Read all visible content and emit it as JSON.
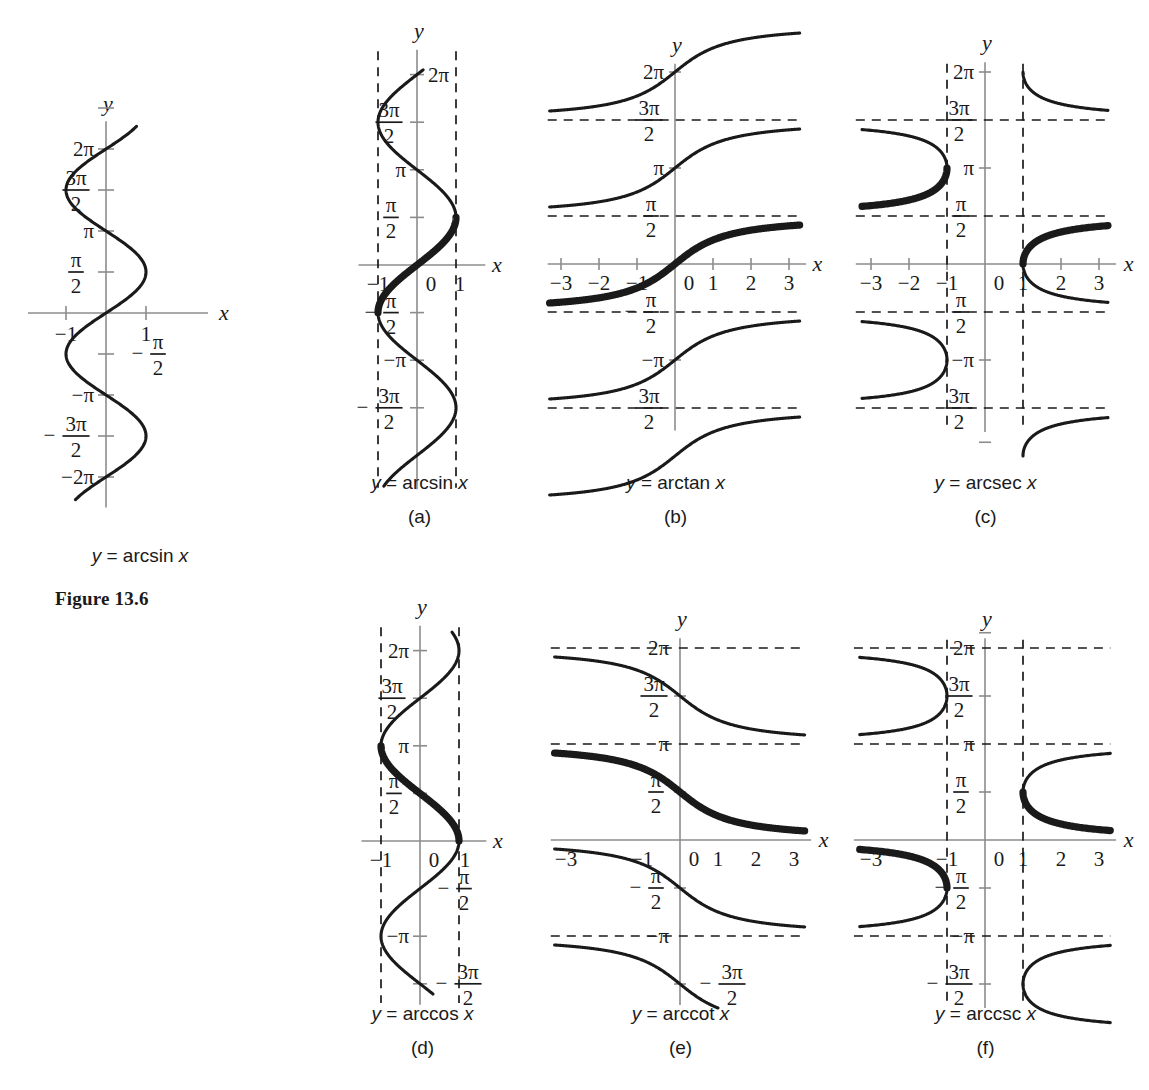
{
  "figure": {
    "label": "Figure 13.6",
    "main_caption": "y = arcsin x"
  },
  "panels": [
    {
      "id": "a",
      "caption": "y = arcsin x",
      "letter": "(a)",
      "function": "arcsin"
    },
    {
      "id": "b",
      "caption": "y = arctan x",
      "letter": "(b)",
      "function": "arctan"
    },
    {
      "id": "c",
      "caption": "y = arcsec x",
      "letter": "(c)",
      "function": "arcsec"
    },
    {
      "id": "d",
      "caption": "y = arccos x",
      "letter": "(d)",
      "function": "arccos"
    },
    {
      "id": "e",
      "caption": "y = arccot x",
      "letter": "(e)",
      "function": "arccot"
    },
    {
      "id": "f",
      "caption": "y = arccsc x",
      "letter": "(f)",
      "function": "arccsc"
    }
  ],
  "axis_names": {
    "x": "x",
    "y": "y"
  },
  "tick_labels": {
    "two_pi": "2π",
    "three_pi_over_two": "3π/2",
    "pi": "π",
    "pi_over_two": "π/2",
    "neg_pi_over_two": "−π/2",
    "neg_pi": "−π",
    "neg_three_pi_over_two": "− 3π/2",
    "neg_two_pi": "−2π",
    "x_neg3": "−3",
    "x_neg2": "−2",
    "x_neg1": "−1",
    "x_0": "0",
    "x_1": "1",
    "x_2": "2",
    "x_3": "3"
  },
  "chart_data": [
    {
      "type": "line",
      "name": "main-arcsin",
      "title": "y = arcsin x",
      "xlabel": "x",
      "ylabel": "y",
      "xlim": [
        -1.55,
        1.55
      ],
      "ylim": [
        -7.3,
        7.6
      ],
      "grid": false,
      "legend": null,
      "description": "Full multivalued arcsine relation: sideways sine curve x = sin y",
      "xticks": [
        -1,
        1
      ],
      "xticklabels": [
        "−1",
        "1"
      ],
      "yticks": [
        -6.283,
        -4.712,
        -3.142,
        -1.571,
        1.571,
        3.142,
        4.712,
        6.283
      ],
      "yticklabels": [
        "−2π",
        "− 3π/2",
        "−π",
        "−π/2",
        "π/2",
        "π",
        "3π/2",
        "2π"
      ],
      "series": [
        {
          "name": "x = sin y",
          "relation": "x=sin(y)",
          "y_range": [
            -7.1,
            7.1
          ],
          "bold": false
        }
      ]
    },
    {
      "type": "line",
      "name": "panel-a-arcsin",
      "title": "y = arcsin x",
      "xlabel": "x",
      "ylabel": "y",
      "xlim": [
        -1.45,
        1.45
      ],
      "ylim": [
        -7.6,
        7.3
      ],
      "grid": false,
      "asymptotes_vertical": [
        -1,
        1
      ],
      "xticks": [
        -1,
        0,
        1
      ],
      "xticklabels": [
        "−1",
        "0",
        "1"
      ],
      "yticks": [
        -4.712,
        -3.142,
        -1.571,
        1.571,
        3.142,
        4.712,
        6.283
      ],
      "yticklabels": [
        "− 3π/2",
        "−π",
        "−π/2",
        "π/2",
        "π",
        "3π/2",
        "2π"
      ],
      "series": [
        {
          "name": "all branches",
          "relation": "x=sin(y)",
          "y_range": [
            -7.2,
            6.45
          ],
          "bold": false
        },
        {
          "name": "principal branch",
          "relation": "x=sin(y)",
          "y_range": [
            -1.571,
            1.571
          ],
          "bold": true
        }
      ]
    },
    {
      "type": "line",
      "name": "panel-b-arctan",
      "title": "y = arctan x",
      "xlabel": "x",
      "ylabel": "y",
      "xlim": [
        -3.3,
        3.3
      ],
      "ylim": [
        -5.6,
        6.7
      ],
      "grid": false,
      "asymptotes_horizontal": [
        -4.712,
        -1.571,
        1.571,
        4.712
      ],
      "xticks": [
        -3,
        -2,
        -1,
        0,
        1,
        2,
        3
      ],
      "xticklabels": [
        "−3",
        "−2",
        "−1",
        "0",
        "1",
        "2",
        "3"
      ],
      "yticks": [
        -4.712,
        -3.142,
        -1.571,
        1.571,
        3.142,
        4.712,
        6.283
      ],
      "yticklabels": [
        "3π/2",
        "−π",
        "−π/2",
        "π/2",
        "π",
        "3π/2",
        "2π"
      ],
      "series": [
        {
          "name": "branch k=-2",
          "relation": "atan(x)-2*pi",
          "bold": false
        },
        {
          "name": "branch k=-1",
          "relation": "atan(x)-pi",
          "bold": false
        },
        {
          "name": "principal branch",
          "relation": "atan(x)",
          "bold": true
        },
        {
          "name": "branch k=1",
          "relation": "atan(x)+pi",
          "bold": false
        },
        {
          "name": "branch k=2",
          "relation": "atan(x)+2*pi",
          "bold": false
        }
      ]
    },
    {
      "type": "line",
      "name": "panel-c-arcsec",
      "title": "y = arcsec x",
      "xlabel": "x",
      "ylabel": "y",
      "xlim": [
        -3.3,
        3.3
      ],
      "ylim": [
        -5.6,
        6.7
      ],
      "grid": false,
      "asymptotes_vertical": [
        -1,
        1
      ],
      "asymptotes_horizontal": [
        -4.712,
        -1.571,
        1.571,
        4.712
      ],
      "xticks": [
        -3,
        -2,
        -1,
        0,
        1,
        2,
        3
      ],
      "xticklabels": [
        "−3",
        "−2",
        "−1",
        "0",
        "1",
        "2",
        "3"
      ],
      "yticks": [
        -4.712,
        -3.142,
        -1.571,
        1.571,
        3.142,
        4.712,
        6.283
      ],
      "yticklabels": [
        "3π/2",
        "−π",
        "−π/2",
        "π/2",
        "π",
        "3π/2",
        "2π"
      ],
      "series": [
        {
          "name": "principal right branch",
          "relation": "x=sec(y)",
          "y_range": [
            0,
            1.231
          ],
          "bold": true
        },
        {
          "name": "principal left branch",
          "relation": "x=sec(y)",
          "y_range": [
            1.911,
            3.142
          ],
          "bold": true
        },
        {
          "name": "other branches",
          "relation": "x=sec(y)",
          "bold": false
        }
      ]
    },
    {
      "type": "line",
      "name": "panel-d-arccos",
      "title": "y = arccos x",
      "xlabel": "x",
      "ylabel": "y",
      "xlim": [
        -1.45,
        1.45
      ],
      "ylim": [
        -5.6,
        7.3
      ],
      "grid": false,
      "asymptotes_vertical": [
        -1,
        1
      ],
      "xticks": [
        -1,
        0,
        1
      ],
      "xticklabels": [
        "−1",
        "0",
        "1"
      ],
      "yticks": [
        -4.712,
        -3.142,
        -1.571,
        1.571,
        3.142,
        4.712,
        6.283
      ],
      "yticklabels": [
        "− 3π/2",
        "−π",
        "−π/2",
        "π/2",
        "π",
        "3π/2",
        "2π"
      ],
      "series": [
        {
          "name": "all branches",
          "relation": "x=cos(y)",
          "y_range": [
            -5.1,
            6.9
          ],
          "bold": false
        },
        {
          "name": "principal branch",
          "relation": "x=cos(y)",
          "y_range": [
            0,
            3.142
          ],
          "bold": true
        }
      ]
    },
    {
      "type": "line",
      "name": "panel-e-arccot",
      "title": "y = arccot x",
      "xlabel": "x",
      "ylabel": "y",
      "xlim": [
        -3.3,
        3.3
      ],
      "ylim": [
        -5.6,
        6.7
      ],
      "grid": false,
      "asymptotes_horizontal": [
        -3.142,
        0,
        3.142,
        6.283
      ],
      "xticks": [
        -3,
        -1,
        0,
        1,
        2,
        3
      ],
      "xticklabels": [
        "−3",
        "−1",
        "0",
        "1",
        "2",
        "3"
      ],
      "yticks": [
        -4.712,
        -3.142,
        -1.571,
        1.571,
        3.142,
        4.712,
        6.283
      ],
      "yticklabels": [
        "− 3π/2",
        "−π",
        "−π/2",
        "π/2",
        "3π/2",
        "π",
        "2π"
      ],
      "series": [
        {
          "name": "branch k=-1",
          "relation": "acot(x)-pi",
          "bold": false
        },
        {
          "name": "principal branch",
          "relation": "acot(x)",
          "bold": true
        },
        {
          "name": "branch k=1",
          "relation": "acot(x)+pi",
          "bold": false
        },
        {
          "name": "branch k=2",
          "relation": "acot(x)+2*pi",
          "bold": false
        }
      ]
    },
    {
      "type": "line",
      "name": "panel-f-arccsc",
      "title": "y = arccsc x",
      "xlabel": "x",
      "ylabel": "y",
      "xlim": [
        -3.3,
        3.3
      ],
      "ylim": [
        -5.6,
        6.7
      ],
      "grid": false,
      "asymptotes_vertical": [
        -1,
        1
      ],
      "asymptotes_horizontal": [
        -3.142,
        3.142,
        6.283
      ],
      "xticks": [
        -3,
        -1,
        0,
        1,
        2,
        3
      ],
      "xticklabels": [
        "−3",
        "−1",
        "0",
        "1",
        "2",
        "3"
      ],
      "yticks": [
        -4.712,
        -3.142,
        -1.571,
        1.571,
        3.142,
        4.712,
        6.283
      ],
      "yticklabels": [
        "− 3π/2",
        "−π",
        "−π/2",
        "π/2",
        "π",
        "3π/2",
        "2π"
      ],
      "series": [
        {
          "name": "principal right branch",
          "relation": "x=csc(y)",
          "y_range": [
            0.34,
            1.571
          ],
          "bold": true
        },
        {
          "name": "principal left branch",
          "relation": "x=csc(y)",
          "y_range": [
            -1.571,
            -0.34
          ],
          "bold": true
        },
        {
          "name": "other branches",
          "relation": "x=csc(y)",
          "bold": false
        }
      ]
    }
  ]
}
